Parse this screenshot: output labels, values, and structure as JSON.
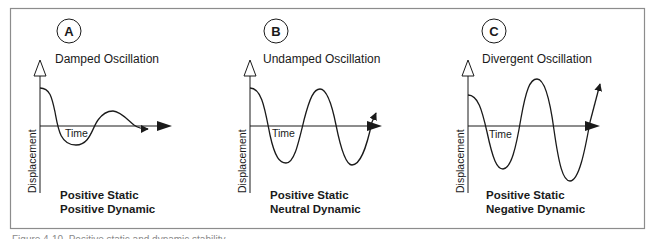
{
  "figure": {
    "frame_color": "#8c8c8c",
    "ink_color": "#1a1a1a",
    "caption": "Figure 4-10. Positive static and dynamic stability"
  },
  "panels": [
    {
      "badge": "A",
      "title": "Damped Oscillation",
      "y_axis_label": "Displacement",
      "x_axis_label": "Time",
      "verdict_line1": "Positive Static",
      "verdict_line2": "Positive Dynamic"
    },
    {
      "badge": "B",
      "title": "Undamped Oscillation",
      "y_axis_label": "Displacement",
      "x_axis_label": "Time",
      "verdict_line1": "Positive Static",
      "verdict_line2": "Neutral Dynamic"
    },
    {
      "badge": "C",
      "title": "Divergent Oscillation",
      "y_axis_label": "Displacement",
      "x_axis_label": "Time",
      "verdict_line1": "Positive Static",
      "verdict_line2": "Negative Dynamic"
    }
  ]
}
